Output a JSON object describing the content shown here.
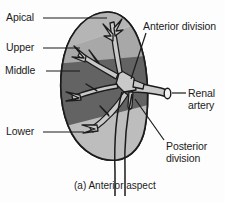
{
  "figure": {
    "caption": "(a) Anterior aspect",
    "background_color": "#fdfdfd"
  },
  "labels": {
    "apical": "Apical",
    "upper": "Upper",
    "middle": "Middle",
    "lower": "Lower",
    "anterior_division": "Anterior division",
    "renal_artery_line1": "Renal",
    "renal_artery_line2": "artery",
    "posterior_division_line1": "Posterior",
    "posterior_division_line2": "division"
  },
  "colors": {
    "outline": "#1b1b1b",
    "kidney_light": "#bdbdbd",
    "kidney_mid": "#a8a8a8",
    "kidney_dark": "#636363",
    "vessel_fill": "#c9c9c9",
    "text": "#1b1b1b",
    "background": "#fdfdfd"
  },
  "segments": [
    {
      "name": "apical",
      "shade": "light"
    },
    {
      "name": "upper",
      "shade": "mid"
    },
    {
      "name": "middle",
      "shade": "dark"
    },
    {
      "name": "lower",
      "shade": "light"
    }
  ],
  "structures": [
    {
      "name": "renal-artery-trunk"
    },
    {
      "name": "anterior-division-branch"
    },
    {
      "name": "posterior-division-branch"
    },
    {
      "name": "ureter"
    }
  ]
}
